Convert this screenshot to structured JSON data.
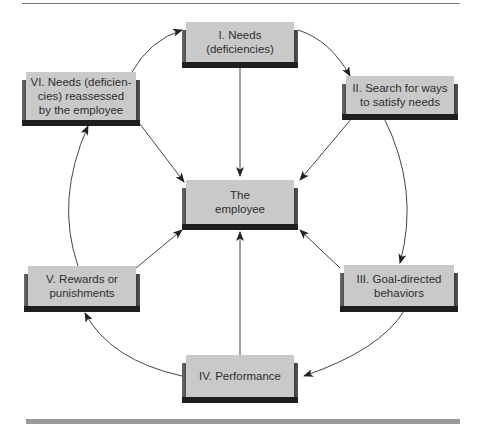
{
  "diagram": {
    "type": "cycle-with-hub",
    "colors": {
      "box_face": "#c9c9c9",
      "box_shadow": "#2a2a2a",
      "arrow": "#333333",
      "rule": "#777777",
      "bottom_bar": "#9a9a9a"
    },
    "hub": {
      "lines": [
        "The",
        "employee"
      ]
    },
    "stages": [
      {
        "id": "I",
        "lines": [
          "I. Needs",
          "(deficiencies)"
        ]
      },
      {
        "id": "II",
        "lines": [
          "II. Search for ways",
          "to satisfy needs"
        ]
      },
      {
        "id": "III",
        "lines": [
          "III.  Goal-directed",
          "behaviors"
        ]
      },
      {
        "id": "IV",
        "lines": [
          "IV.  Performance"
        ]
      },
      {
        "id": "V",
        "lines": [
          "V.  Rewards or",
          "punishments"
        ]
      },
      {
        "id": "VI",
        "lines": [
          "VI.  Needs  (deficien-",
          "cies) reassessed",
          "by  the employee"
        ]
      }
    ],
    "edges": [
      {
        "from": "I",
        "to": "II",
        "kind": "cycle"
      },
      {
        "from": "II",
        "to": "III",
        "kind": "cycle"
      },
      {
        "from": "III",
        "to": "IV",
        "kind": "cycle"
      },
      {
        "from": "IV",
        "to": "V",
        "kind": "cycle"
      },
      {
        "from": "V",
        "to": "VI",
        "kind": "cycle"
      },
      {
        "from": "VI",
        "to": "I",
        "kind": "cycle"
      },
      {
        "from": "I",
        "to": "hub",
        "kind": "spoke"
      },
      {
        "from": "II",
        "to": "hub",
        "kind": "spoke"
      },
      {
        "from": "III",
        "to": "hub",
        "kind": "spoke"
      },
      {
        "from": "IV",
        "to": "hub",
        "kind": "spoke"
      },
      {
        "from": "V",
        "to": "hub",
        "kind": "spoke"
      },
      {
        "from": "VI",
        "to": "hub",
        "kind": "spoke"
      }
    ]
  }
}
